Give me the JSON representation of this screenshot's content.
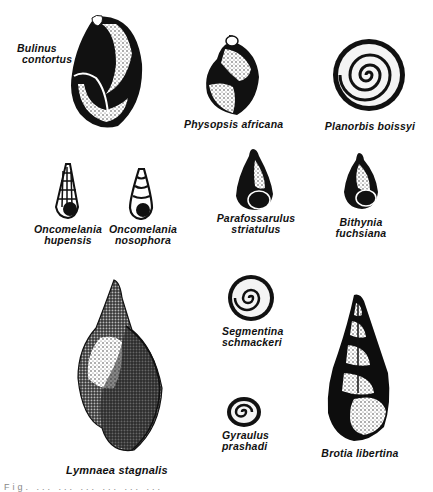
{
  "figure": {
    "species": [
      {
        "id": "bulinus",
        "genus": "Bulinus",
        "epithet": "contortus",
        "shape": "globose-dark"
      },
      {
        "id": "physopsis",
        "genus": "Physopsis",
        "epithet": "africana",
        "shape": "globose"
      },
      {
        "id": "planorbis",
        "genus": "Planorbis",
        "epithet": "boissyi",
        "shape": "planispiral"
      },
      {
        "id": "onco-hupensis",
        "genus": "Oncomelania",
        "epithet": "hupensis",
        "shape": "turreted-ribbed"
      },
      {
        "id": "onco-nosophora",
        "genus": "Oncomelania",
        "epithet": "nosophora",
        "shape": "turreted"
      },
      {
        "id": "parafossarulus",
        "genus": "Parafossarulus",
        "epithet": "striatulus",
        "shape": "conical"
      },
      {
        "id": "bithynia",
        "genus": "Bithynia",
        "epithet": "fuchsiana",
        "shape": "conical"
      },
      {
        "id": "lymnaea",
        "genus": "Lymnaea",
        "epithet": "stagnalis",
        "shape": "elongate-stippled"
      },
      {
        "id": "segmentina",
        "genus": "Segmentina",
        "epithet": "schmackeri",
        "shape": "planispiral"
      },
      {
        "id": "gyraulus",
        "genus": "Gyraulus",
        "epithet": "prashadi",
        "shape": "planispiral-small"
      },
      {
        "id": "brotia",
        "genus": "Brotia",
        "epithet": "libertina",
        "shape": "elongate-dark"
      }
    ],
    "labels": {
      "bulinus": {
        "line1": "Bulinus",
        "line2": "contortus"
      },
      "physopsis": {
        "line1": "Physopsis africana"
      },
      "planorbis": {
        "line1": "Planorbis boissyi"
      },
      "onco_hupensis": {
        "line1": "Oncomelania",
        "line2": "hupensis"
      },
      "onco_nosophora": {
        "line1": "Oncomelania",
        "line2": "nosophora"
      },
      "parafossarulus": {
        "line1": "Parafossarulus",
        "line2": "striatulus"
      },
      "bithynia": {
        "line1": "Bithynia",
        "line2": "fuchsiana"
      },
      "lymnaea": {
        "line1": "Lymnaea stagnalis"
      },
      "segmentina": {
        "line1": "Segmentina",
        "line2": "schmackeri"
      },
      "gyraulus": {
        "line1": "Gyraulus",
        "line2": "prashadi"
      },
      "brotia": {
        "line1": "Brotia libertina"
      }
    },
    "caption_partial": "Fig. ... ... ... ... ... ..."
  },
  "colors": {
    "ink": "#111111",
    "paper": "#ffffff",
    "stipple": "#555555"
  }
}
